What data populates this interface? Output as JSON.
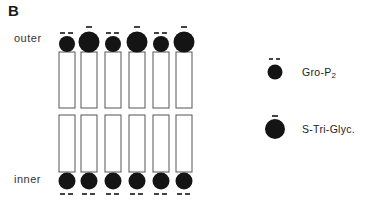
{
  "panel_label": "B",
  "leaflet_labels": {
    "outer": "outer",
    "inner": "inner"
  },
  "legend": [
    {
      "id": "gro-p2",
      "label_main": "Gro-P",
      "label_sub": "2",
      "charge": "--",
      "size": "small"
    },
    {
      "id": "s-tri-glyc",
      "label_main": "S-Tri-Glyc.",
      "label_sub": "",
      "charge": "-",
      "size": "large"
    }
  ],
  "columns": 6,
  "outer_heads": [
    "gro-p2",
    "s-tri-glyc",
    "gro-p2",
    "s-tri-glyc",
    "gro-p2",
    "s-tri-glyc"
  ],
  "inner_heads": [
    "gro-p2",
    "gro-p2",
    "gro-p2",
    "gro-p2",
    "gro-p2",
    "gro-p2"
  ],
  "colors": {
    "head": "#141414",
    "outline": "#555555",
    "background": "#ffffff"
  }
}
